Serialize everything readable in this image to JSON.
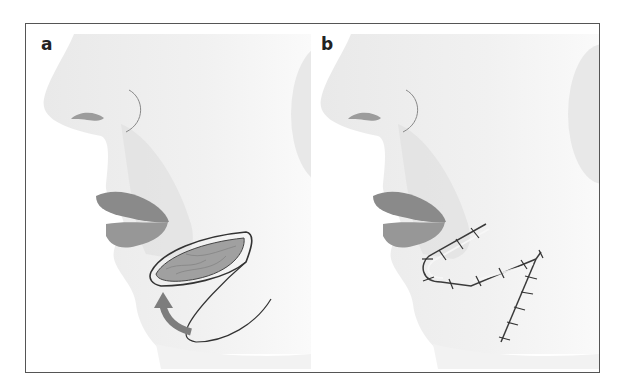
{
  "figure": {
    "panels": [
      {
        "label": "a",
        "description": "Lateral profile of lower face; lip flap being raised from chin with curved arrow indicating rotation upward"
      },
      {
        "label": "b",
        "description": "Lateral profile after flap transposition; sutured incision lines forming curved and angled (V-shaped) scar on chin"
      }
    ],
    "colors": {
      "frame": "#555555",
      "skin": "#ececec",
      "skin_shadow": "#dcdcdc",
      "lip": "#8a8a8a",
      "flap_fill": "#9a9a9a",
      "arrow": "#7d7d7d",
      "suture": "#3a3a3a"
    }
  }
}
